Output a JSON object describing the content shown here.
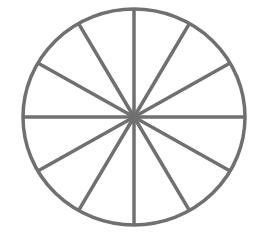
{
  "diagram": {
    "type": "circle-divided-into-sectors",
    "sectors": 12,
    "center": {
      "x": 134,
      "y": 117
    },
    "radius_x": 111,
    "radius_y": 108,
    "stroke_color": "#707070",
    "stroke_width": 3.5,
    "background": "#ffffff",
    "spoke_angles_deg": [
      0,
      30,
      60,
      90,
      120,
      150,
      180,
      210,
      240,
      270,
      300,
      330
    ]
  }
}
